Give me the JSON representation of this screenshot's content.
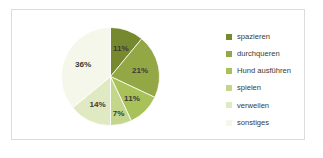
{
  "frame": {
    "border_color": "#dcdcdc",
    "background": "#ffffff"
  },
  "legend": {
    "position": "right",
    "items": [
      {
        "label": "spazieren",
        "color": "#76892f"
      },
      {
        "label": "durchqueren",
        "color": "#93a845"
      },
      {
        "label": "Hund ausführen",
        "color": "#a8c158"
      },
      {
        "label": "spielen",
        "color": "#c4d68c"
      },
      {
        "label": "verweilen",
        "color": "#dfe9c2"
      },
      {
        "label": "sonstiges",
        "color": "#f4f7e9"
      }
    ]
  },
  "chart_data": {
    "type": "pie",
    "title": "",
    "start_angle_deg": 0,
    "direction": "clockwise",
    "grid": false,
    "legend_position": "right",
    "categories": [
      "spazieren",
      "durchqueren",
      "Hund ausführen",
      "spielen",
      "verweilen",
      "sonstiges"
    ],
    "values": [
      11,
      21,
      11,
      7,
      14,
      36
    ],
    "value_unit": "%",
    "data_labels": [
      "11%",
      "21%",
      "11%",
      "7%",
      "14%",
      "36%"
    ],
    "colors": [
      "#76892f",
      "#93a845",
      "#a8c158",
      "#c4d68c",
      "#dfe9c2",
      "#f4f7e9"
    ],
    "label_color": "#3b3b35",
    "slice_separator_color": "#ffffff"
  }
}
